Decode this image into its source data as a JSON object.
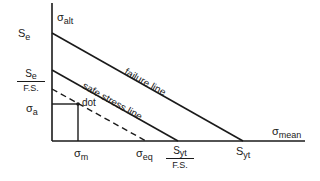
{
  "diagram": {
    "type": "goodman-safe-stress",
    "y_axis_label": {
      "sym": "σ",
      "sub": "alt"
    },
    "x_axis_label": {
      "sym": "σ",
      "sub": "mean"
    },
    "y_ticks": {
      "se": {
        "sym": "S",
        "sub": "e"
      },
      "se_fs": {
        "num_sym": "S",
        "num_sub": "e",
        "den": "F.S."
      },
      "sigma_a": {
        "sym": "σ",
        "sub": "a"
      }
    },
    "x_ticks": {
      "sigma_m": {
        "sym": "σ",
        "sub": "m"
      },
      "sigma_eq": {
        "sym": "σ",
        "sub": "eq"
      },
      "syt_fs": {
        "num_sym": "S",
        "num_sub": "yt",
        "den": "F.S."
      },
      "syt": {
        "sym": "S",
        "sub": "yt"
      }
    },
    "lines": {
      "failure": "failure line",
      "safe": "safe stress line"
    },
    "point_label": "dot",
    "line_color": "#1a1a1a"
  }
}
